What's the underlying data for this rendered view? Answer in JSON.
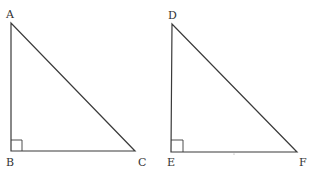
{
  "diagram": {
    "type": "geometry",
    "triangles": [
      {
        "name": "ABC",
        "vertices": {
          "A": {
            "label": "A",
            "x": 11,
            "y": 23
          },
          "B": {
            "label": "B",
            "x": 11,
            "y": 151
          },
          "C": {
            "label": "C",
            "x": 135,
            "y": 151
          }
        },
        "right_angle_at": "B"
      },
      {
        "name": "DEF",
        "vertices": {
          "D": {
            "label": "D",
            "x": 172,
            "y": 24
          },
          "E": {
            "label": "E",
            "x": 171,
            "y": 152
          },
          "F": {
            "label": "F",
            "x": 297,
            "y": 152
          }
        },
        "right_angle_at": "E"
      }
    ],
    "colors": {
      "line": "#3a3a3a",
      "text": "#333333",
      "background": "#ffffff"
    }
  }
}
